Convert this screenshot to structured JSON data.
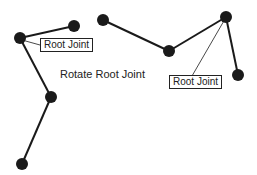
{
  "caption": "Rotate Root Joint",
  "labels": {
    "left": "Root Joint",
    "right": "Root Joint"
  },
  "colors": {
    "ink": "#1a1a1a",
    "background": "#ffffff"
  },
  "skeletons": [
    {
      "name": "left-skeleton",
      "joints": [
        [
          20,
          38
        ],
        [
          74,
          26
        ],
        [
          51,
          97
        ],
        [
          22,
          164
        ]
      ],
      "bones": [
        [
          0,
          1
        ],
        [
          0,
          2
        ],
        [
          2,
          3
        ]
      ],
      "root": 0
    },
    {
      "name": "right-skeleton",
      "joints": [
        [
          103,
          20
        ],
        [
          169,
          51
        ],
        [
          226,
          17
        ],
        [
          238,
          75
        ]
      ],
      "bones": [
        [
          0,
          1
        ],
        [
          1,
          2
        ],
        [
          2,
          3
        ]
      ],
      "root": 2
    }
  ]
}
